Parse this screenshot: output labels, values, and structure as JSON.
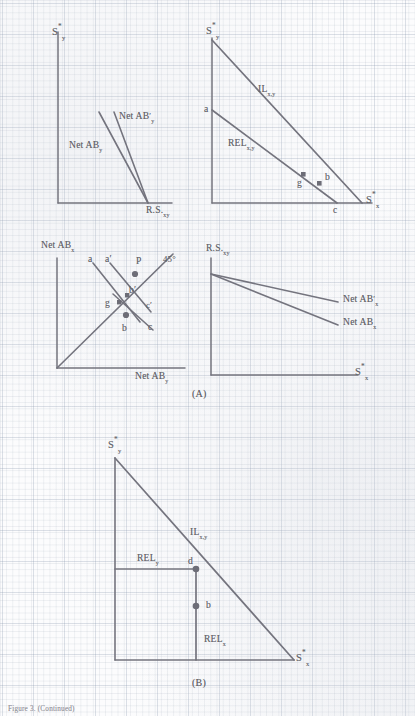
{
  "figure": {
    "caption_a": "(A)",
    "caption_b": "(B)",
    "footer_note": "Figure 3. (Continued)"
  },
  "panels": {
    "p1": {
      "name": "net-arbitrage-panel",
      "y_axis_label": "S*y",
      "x_axis_label": "R.S.xy",
      "curves": [
        {
          "id": "net-ab-y",
          "label": "Net ABy"
        },
        {
          "id": "net-ab-y-prime",
          "label": "Net AB'y"
        }
      ]
    },
    "p2": {
      "name": "interest-locus-panel",
      "y_axis_label": "S*y",
      "x_axis_label": "S*x",
      "lines": [
        {
          "id": "il",
          "label": "ILx,y"
        },
        {
          "id": "rel",
          "label": "RELx,y"
        }
      ],
      "points": [
        {
          "id": "a",
          "label": "a"
        },
        {
          "id": "g",
          "label": "g"
        },
        {
          "id": "b",
          "label": "b"
        },
        {
          "id": "c",
          "label": "c"
        }
      ]
    },
    "p3": {
      "name": "forty-five-degree-panel",
      "y_axis_label": "Net ABx",
      "x_axis_label": "Net ABy",
      "diagonal_label": "45°",
      "points": [
        {
          "id": "a",
          "label": "a"
        },
        {
          "id": "a-prime",
          "label": "a'"
        },
        {
          "id": "b-prime",
          "label": "b'"
        },
        {
          "id": "c-prime",
          "label": "c'"
        },
        {
          "id": "g",
          "label": "g"
        },
        {
          "id": "b",
          "label": "b"
        },
        {
          "id": "c",
          "label": "c"
        },
        {
          "id": "p",
          "label": "P"
        }
      ]
    },
    "p4": {
      "name": "relative-supply-panel",
      "y_axis_label": "R.S.xy",
      "x_axis_label": "S*x",
      "curves": [
        {
          "id": "net-ab-x-prime",
          "label": "Net AB'x"
        },
        {
          "id": "net-ab-x",
          "label": "Net ABx"
        }
      ]
    },
    "pB": {
      "name": "panel-b-interest-locus",
      "y_axis_label": "S*y",
      "x_axis_label": "S*x",
      "lines": [
        {
          "id": "il",
          "label": "ILx,y"
        },
        {
          "id": "rel-y",
          "label": "RELy"
        },
        {
          "id": "rel-x",
          "label": "RELx"
        }
      ],
      "points": [
        {
          "id": "d",
          "label": "d"
        },
        {
          "id": "b",
          "label": "b"
        }
      ]
    }
  },
  "colors": {
    "ink": "#636368",
    "line": "#70707a",
    "grid": "#96a2b4",
    "paper": "#fcfcfd"
  }
}
